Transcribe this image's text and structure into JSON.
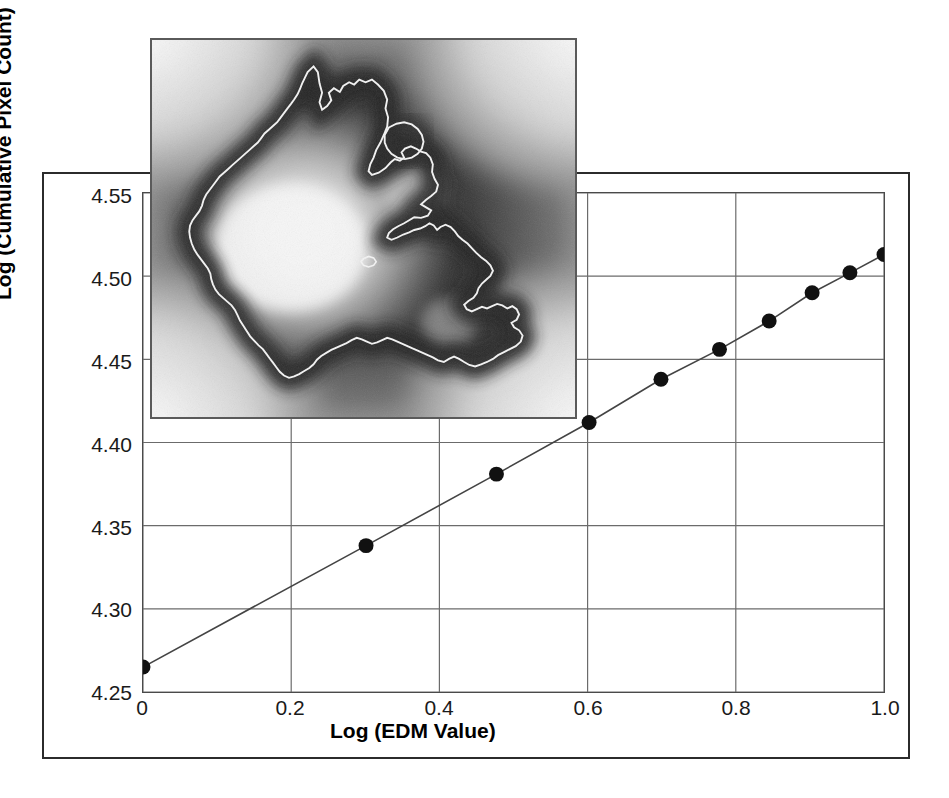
{
  "figure": {
    "type": "scientific-plot",
    "has_outer_border": true
  },
  "axes": {
    "x": {
      "title": "Log (EDM Value)",
      "ticks": [
        "0",
        "0.2",
        "0.4",
        "0.6",
        "0.8",
        "1.0"
      ],
      "tick_values": [
        0,
        0.2,
        0.4,
        0.6,
        0.8,
        1.0
      ],
      "min": 0,
      "max": 1.0
    },
    "y": {
      "title": "Log (Cumulative Pixel Count)",
      "ticks": [
        "4.25",
        "4.30",
        "4.35",
        "4.40",
        "4.45",
        "4.50",
        "4.55"
      ],
      "tick_values": [
        4.25,
        4.3,
        4.35,
        4.4,
        4.45,
        4.5,
        4.55
      ],
      "min": 4.25,
      "max": 4.55
    }
  },
  "inset": {
    "name": "edm-grayscale-image",
    "description": "Euclidean Distance Map grayscale image with white outline contour",
    "border_color": "#5a5a5a"
  },
  "colors": {
    "marker": "#111111",
    "line": "#444444",
    "grid": "#6b6b6b",
    "axis": "#2b2b2b",
    "text": "#000000"
  },
  "chart_data": {
    "type": "scatter",
    "title": "",
    "xlabel": "Log (EDM Value)",
    "ylabel": "Log (Cumulative Pixel Count)",
    "xlim": [
      0,
      1.0
    ],
    "ylim": [
      4.25,
      4.55
    ],
    "xticks": [
      0,
      0.2,
      0.4,
      0.6,
      0.8,
      1.0
    ],
    "yticks": [
      4.25,
      4.3,
      4.35,
      4.4,
      4.45,
      4.5,
      4.55
    ],
    "grid": true,
    "legend": null,
    "series": [
      {
        "name": "Cumulative pixel count vs EDM value",
        "marker": "filled-circle",
        "connected_by_line": true,
        "x": [
          0.0,
          0.301,
          0.477,
          0.602,
          0.699,
          0.778,
          0.845,
          0.903,
          0.954,
          1.0
        ],
        "y": [
          4.265,
          4.338,
          4.381,
          4.412,
          4.438,
          4.456,
          4.473,
          4.49,
          4.502,
          4.513
        ]
      }
    ]
  }
}
